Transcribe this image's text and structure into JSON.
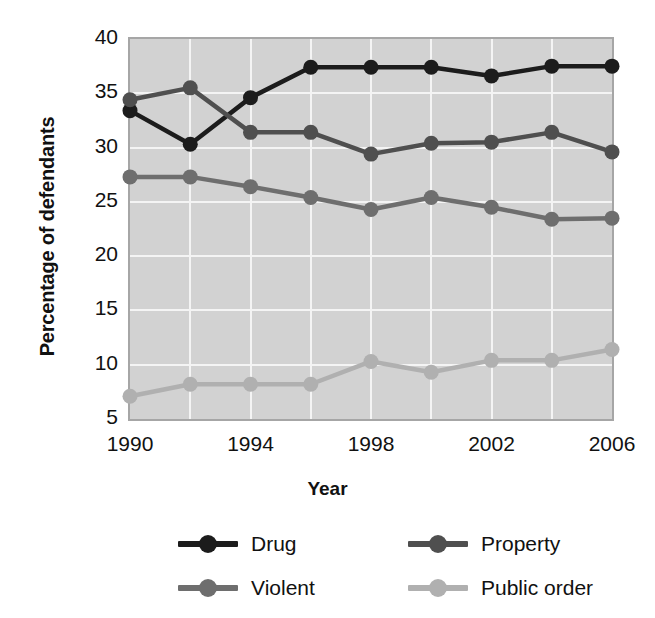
{
  "chart_data": {
    "type": "line",
    "title": "",
    "xlabel": "Year",
    "ylabel": "Percentage of defendants",
    "x": [
      1990,
      1992,
      1994,
      1996,
      1998,
      2000,
      2002,
      2004,
      2006
    ],
    "xtick_labels": [
      "1990",
      "1994",
      "1998",
      "2002",
      "2006"
    ],
    "xtick_values": [
      1990,
      1994,
      1998,
      2002,
      2006
    ],
    "ytick_labels": [
      "5",
      "10",
      "15",
      "20",
      "25",
      "30",
      "35",
      "40"
    ],
    "ytick_values": [
      5,
      10,
      15,
      20,
      25,
      30,
      35,
      40
    ],
    "xlim": [
      1990,
      2006
    ],
    "ylim": [
      5,
      40
    ],
    "grid": true,
    "legend_position": "bottom",
    "series": [
      {
        "name": "Drug",
        "color": "#1c1c1c",
        "values": [
          33.4,
          30.3,
          34.6,
          37.4,
          37.4,
          37.4,
          36.6,
          37.5,
          37.5
        ]
      },
      {
        "name": "Property",
        "color": "#4f4f4f",
        "values": [
          34.4,
          35.5,
          31.4,
          31.4,
          29.4,
          30.4,
          30.5,
          31.4,
          29.6
        ]
      },
      {
        "name": "Violent",
        "color": "#6e6e6e",
        "values": [
          27.3,
          27.3,
          26.4,
          25.4,
          24.3,
          25.4,
          24.5,
          23.4,
          23.5
        ]
      },
      {
        "name": "Public order",
        "color": "#b0b0b0",
        "values": [
          7.1,
          8.2,
          8.2,
          8.2,
          10.3,
          9.3,
          10.4,
          10.4,
          11.4
        ]
      }
    ]
  },
  "legend": {
    "items": [
      {
        "label": "Drug",
        "color": "#1c1c1c"
      },
      {
        "label": "Property",
        "color": "#4f4f4f"
      },
      {
        "label": "Violent",
        "color": "#6e6e6e"
      },
      {
        "label": "Public order",
        "color": "#b0b0b0"
      }
    ]
  },
  "style": {
    "plot_background": "#d2d2d2",
    "grid_color": "#f4f4f4",
    "frame_color": "#a6a6a6",
    "text_color": "#111111"
  }
}
